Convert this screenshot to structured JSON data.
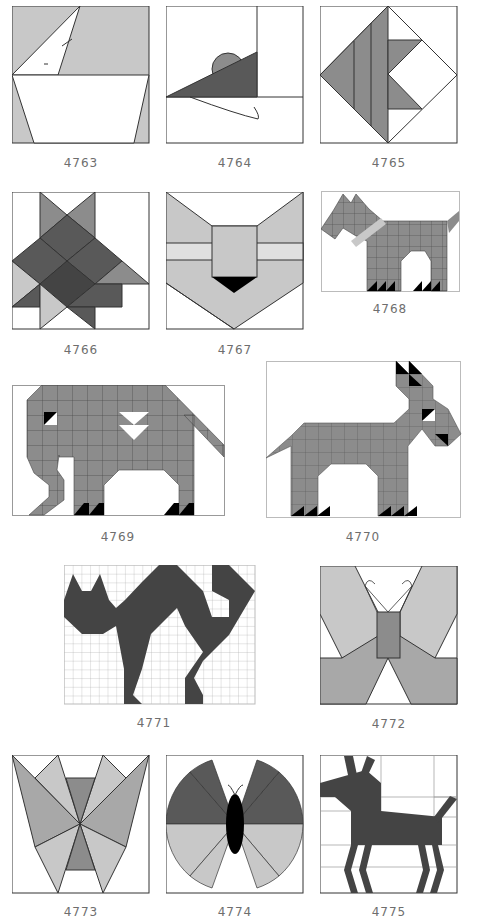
{
  "colors": {
    "light": "#c8c8c8",
    "medium": "#8c8c8c",
    "dark": "#595959",
    "darker": "#444444",
    "black": "#000000",
    "line": "#333333",
    "label": "#6e6e6e"
  },
  "blocks": [
    {
      "id": "4763",
      "subject": "boat"
    },
    {
      "id": "4764",
      "subject": "mouse"
    },
    {
      "id": "4765",
      "subject": "fish"
    },
    {
      "id": "4766",
      "subject": "tree"
    },
    {
      "id": "4767",
      "subject": "fox"
    },
    {
      "id": "4768",
      "subject": "scottie dog"
    },
    {
      "id": "4769",
      "subject": "elephant"
    },
    {
      "id": "4770",
      "subject": "donkey"
    },
    {
      "id": "4771",
      "subject": "cat"
    },
    {
      "id": "4772",
      "subject": "butterfly"
    },
    {
      "id": "4773",
      "subject": "moth"
    },
    {
      "id": "4774",
      "subject": "round butterfly"
    },
    {
      "id": "4775",
      "subject": "deer"
    }
  ]
}
